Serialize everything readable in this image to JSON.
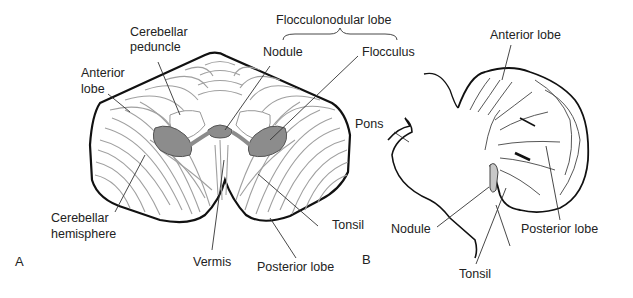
{
  "figure": {
    "panel_a": {
      "panel_label": "A",
      "labels": {
        "cerebellar_peduncle_1": "Cerebellar",
        "cerebellar_peduncle_2": "peduncle",
        "anterior_lobe_1": "Anterior",
        "anterior_lobe_2": "lobe",
        "flocculonodular_lobe": "Flocculonodular lobe",
        "nodule": "Nodule",
        "flocculus": "Flocculus",
        "cerebellar_hemisphere_1": "Cerebellar",
        "cerebellar_hemisphere_2": "hemisphere",
        "vermis": "Vermis",
        "tonsil": "Tonsil",
        "posterior_lobe": "Posterior lobe"
      }
    },
    "panel_b": {
      "panel_label": "B",
      "labels": {
        "anterior_lobe": "Anterior lobe",
        "pons": "Pons",
        "nodule": "Nodule",
        "tonsil": "Tonsil",
        "posterior_lobe": "Posterior lobe"
      }
    },
    "colors": {
      "outline": "#111111",
      "folia": "#9a9a9a",
      "flocculonodular_fill": "#8c8c8c",
      "nodule_fill_b": "#c8c8c8"
    }
  }
}
